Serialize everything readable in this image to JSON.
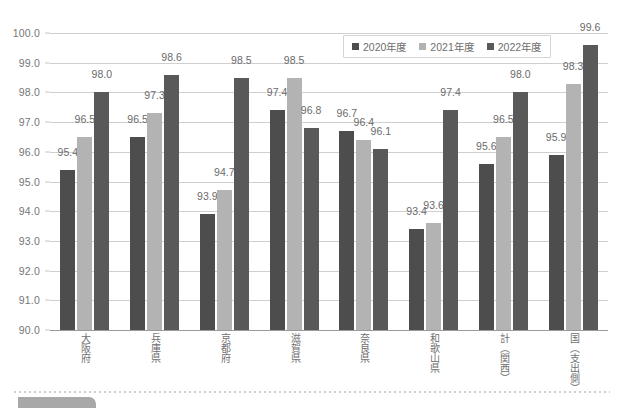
{
  "chart_data": {
    "type": "bar",
    "title": "",
    "xlabel": "",
    "ylabel": "",
    "ylim": [
      90.0,
      100.0
    ],
    "ytick_step": 1.0,
    "yticks": [
      "100.0",
      "99.0",
      "98.0",
      "97.0",
      "96.0",
      "95.0",
      "94.0",
      "93.0",
      "92.0",
      "91.0",
      "90.0"
    ],
    "grid": true,
    "legend_position": "top-right",
    "categories": [
      "大阪府",
      "兵庫県",
      "京都府",
      "滋賀県",
      "奈良県",
      "和歌山県",
      "計\n（関西）",
      "国\n（支出側）"
    ],
    "series": [
      {
        "name": "2020年度",
        "color": "#4d4d4d",
        "values": [
          95.4,
          96.5,
          93.9,
          97.4,
          96.7,
          93.4,
          95.6,
          95.9
        ],
        "labels": [
          "95.4",
          "96.5",
          "93.9",
          "97.4",
          "96.7",
          "93.4",
          "95.6",
          "95.9"
        ]
      },
      {
        "name": "2021年度",
        "color": "#b3b3b3",
        "values": [
          96.5,
          97.3,
          94.7,
          98.5,
          96.4,
          93.6,
          96.5,
          98.3
        ],
        "labels": [
          "96.5",
          "97.3",
          "94.7",
          "98.5",
          "96.4",
          "93.6",
          "96.5",
          "98.3"
        ]
      },
      {
        "name": "2022年度",
        "color": "#595959",
        "values": [
          98.0,
          98.6,
          98.5,
          96.8,
          96.1,
          97.4,
          98.0,
          99.6
        ],
        "labels": [
          "98.0",
          "98.6",
          "98.5",
          "96.8",
          "96.1",
          "97.4",
          "98.0",
          "99.6"
        ]
      }
    ]
  },
  "x_axis": {
    "labels": [
      "大阪府",
      "兵庫県",
      "京都府",
      "滋賀県",
      "奈良県",
      "和歌山県",
      "計（関西）",
      "国（支出側）"
    ]
  },
  "legend": {
    "entries": [
      {
        "label": "2020年度",
        "color": "#4d4d4d"
      },
      {
        "label": "2021年度",
        "color": "#b3b3b3"
      },
      {
        "label": "2022年度",
        "color": "#595959"
      }
    ]
  },
  "colors": {
    "series_2020": "#4d4d4d",
    "series_2021": "#b3b3b3",
    "series_2022": "#595959",
    "gridline": "#cfcfcf",
    "axis": "#9a9a9a",
    "text": "#6e6e6e",
    "footer_tab": "#a8a8a8"
  }
}
